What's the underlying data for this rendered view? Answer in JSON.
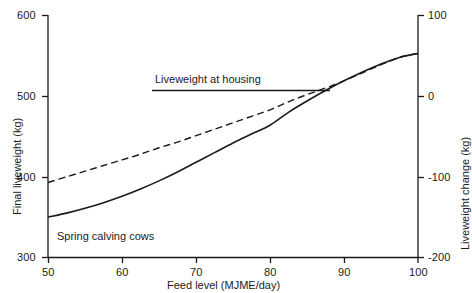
{
  "chart_data": {
    "type": "line",
    "title": "",
    "xlabel": "Feed level (MJME/day)",
    "ylabel": "Final liveweight (kg)",
    "y2label": "Liveweight change (kg)",
    "xlim": [
      50,
      100
    ],
    "ylim": [
      300,
      600
    ],
    "y2lim": [
      -200,
      100
    ],
    "grid": false,
    "legend": "none",
    "xticks": [
      50,
      60,
      70,
      80,
      90,
      100
    ],
    "xtick_labels": [
      "50",
      "60",
      "70",
      "80",
      "90",
      "100"
    ],
    "yticks": [
      300,
      400,
      500,
      600
    ],
    "ytick_labels": [
      "300",
      "400",
      "500",
      "600"
    ],
    "y2ticks": [
      -200,
      -100,
      0,
      100
    ],
    "y2tick_labels": [
      "-200",
      "-100",
      "0",
      "100"
    ],
    "annotations": [
      {
        "name": "liveweight-at-housing",
        "text": "Liveweight at housing",
        "type": "horizontal-reference-line",
        "y_value": 507,
        "x_start": 64,
        "x_end": 88
      },
      {
        "name": "spring-calving-cows",
        "text": "Spring calving cows",
        "type": "text",
        "x_value": 52,
        "y_value": 327
      }
    ],
    "series": [
      {
        "name": "solid-curve",
        "style": "solid",
        "color": "#1a1a1a",
        "x": [
          50,
          52.5,
          55,
          57.5,
          60,
          62.5,
          65,
          67.5,
          70,
          72.5,
          75,
          77.5,
          80,
          82.5,
          85,
          87.5,
          90,
          92.5,
          95,
          97.5,
          100
        ],
        "y": [
          350,
          355,
          361,
          368,
          376,
          385,
          395,
          406,
          418,
          430,
          442,
          453,
          464,
          480,
          494,
          507,
          519,
          530,
          540,
          548,
          553
        ]
      },
      {
        "name": "dashed-curve",
        "style": "dashed",
        "color": "#1a1a1a",
        "x": [
          50,
          52.5,
          55,
          57.5,
          60,
          62.5,
          65,
          67.5,
          70,
          72.5,
          75,
          77.5,
          80,
          82.5,
          85,
          87.5,
          90,
          92.5,
          95,
          97.5,
          100
        ],
        "y": [
          393,
          400,
          407,
          414,
          421,
          428,
          436,
          443,
          451,
          459,
          467,
          475,
          483,
          493,
          502,
          510,
          519,
          529,
          539,
          548,
          553
        ]
      }
    ]
  },
  "axes": {
    "left_title": "Final liveweight (kg)",
    "right_title": "Liveweight change (kg)",
    "bottom_title": "Feed level (MJME/day)"
  },
  "labels": {
    "y_600": "600",
    "y_500": "500",
    "y_400": "400",
    "y_300": "300",
    "x_50": "50",
    "x_60": "60",
    "x_70": "70",
    "x_80": "80",
    "x_90": "90",
    "x_100": "100",
    "y2_100": "100",
    "y2_0": "0",
    "y2_m100": "-100",
    "y2_m200": "-200",
    "housing": "Liveweight at housing",
    "spring": "Spring calving cows"
  },
  "colors": {
    "ink": "#1a1a1a",
    "background": "#ffffff"
  }
}
